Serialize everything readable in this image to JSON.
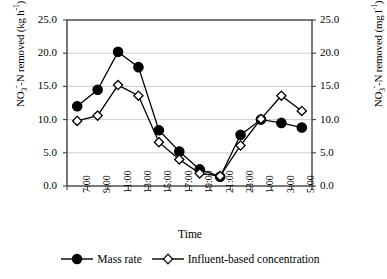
{
  "chart_data": {
    "type": "line",
    "title": "",
    "xlabel": "Time",
    "ylabel": "NO3--N removed (kg h-1)",
    "ylabel_right": "NO3--N removed (mg l-1)",
    "categories": [
      "7:00",
      "9:00",
      "11:00",
      "13:00",
      "15:00",
      "17:00",
      "19:00",
      "21:00",
      "23:00",
      "1:00",
      "3:00",
      "5:00"
    ],
    "ylim": [
      0.0,
      25.0
    ],
    "ylim_right": [
      0.0,
      25.0
    ],
    "ytick_labels": [
      "0.0",
      "5.0",
      "10.0",
      "15.0",
      "20.0",
      "25.0"
    ],
    "ytick_values": [
      0.0,
      5.0,
      10.0,
      15.0,
      20.0,
      25.0
    ],
    "ytick_labels_right": [
      "0.0",
      "5.0",
      "10.0",
      "15.0",
      "20.0",
      "25.0"
    ],
    "grid": true,
    "grid_axis": "y",
    "legend_position": "bottom",
    "series": [
      {
        "name": "Mass rate",
        "marker": "filled-circle",
        "color": "#000000",
        "values": [
          12.0,
          14.5,
          20.2,
          17.9,
          8.4,
          5.2,
          2.5,
          1.4,
          7.7,
          10.0,
          9.5,
          8.8
        ]
      },
      {
        "name": "Influent-based concentration",
        "marker": "open-diamond",
        "color": "#000000",
        "values": [
          9.8,
          10.6,
          15.2,
          13.6,
          6.6,
          4.0,
          1.9,
          1.5,
          6.1,
          10.1,
          13.6,
          11.3
        ]
      }
    ]
  },
  "axis_titles": {
    "left_prefix": "NO",
    "left_sub": "3",
    "left_sup": "-",
    "left_mid": "-N removed (kg h",
    "left_exp": "-1",
    "left_suffix": ")",
    "right_prefix": "NO",
    "right_sub": "3",
    "right_sup": "-",
    "right_mid": "-N removed (mg l",
    "right_exp": "-1",
    "right_suffix": ")"
  },
  "xaxis": {
    "title": "Time"
  },
  "legend": {
    "items": [
      {
        "label": "Mass rate",
        "marker": "filled-circle"
      },
      {
        "label": "Influent-based concentration",
        "marker": "open-diamond"
      }
    ]
  }
}
